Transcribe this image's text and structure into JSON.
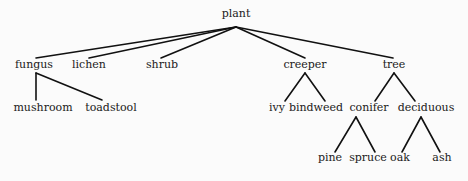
{
  "diagram": {
    "type": "tree",
    "root": "plant",
    "nodes": [
      {
        "id": "plant",
        "label": "plant",
        "x": 236,
        "y": 17,
        "anchor": [
          236,
          27
        ]
      },
      {
        "id": "fungus",
        "label": "fungus",
        "x": 34,
        "y": 68,
        "top": [
          36,
          58
        ],
        "bottom": [
          36,
          73
        ]
      },
      {
        "id": "lichen",
        "label": "lichen",
        "x": 89,
        "y": 68,
        "top": [
          89,
          58
        ]
      },
      {
        "id": "shrub",
        "label": "shrub",
        "x": 162,
        "y": 68,
        "top": [
          161,
          58
        ]
      },
      {
        "id": "creeper",
        "label": "creeper",
        "x": 305,
        "y": 68,
        "top": [
          305,
          58
        ],
        "bottom": [
          305,
          73
        ]
      },
      {
        "id": "tree",
        "label": "tree",
        "x": 394,
        "y": 68,
        "top": [
          393,
          58
        ],
        "bottom": [
          394,
          73
        ]
      },
      {
        "id": "mushroom",
        "label": "mushroom",
        "x": 43,
        "y": 111,
        "top": [
          36,
          100
        ]
      },
      {
        "id": "toadstool",
        "label": "toadstool",
        "x": 111,
        "y": 111,
        "top": [
          102,
          100
        ]
      },
      {
        "id": "ivy",
        "label": "ivy",
        "x": 277,
        "y": 111,
        "top": [
          285,
          101
        ]
      },
      {
        "id": "bindweed",
        "label": "bindweed",
        "x": 316,
        "y": 111,
        "top": [
          325,
          101
        ]
      },
      {
        "id": "conifer",
        "label": "conifer",
        "x": 369,
        "y": 111,
        "top": [
          375,
          101
        ],
        "bottom": [
          356,
          117
        ]
      },
      {
        "id": "deciduous",
        "label": "deciduous",
        "x": 426,
        "y": 111,
        "top": [
          415,
          101
        ],
        "bottom": [
          421,
          117
        ]
      },
      {
        "id": "pine",
        "label": "pine",
        "x": 330,
        "y": 161,
        "top": [
          335,
          152
        ]
      },
      {
        "id": "spruce",
        "label": "spruce",
        "x": 368,
        "y": 161,
        "top": [
          375,
          152
        ]
      },
      {
        "id": "oak",
        "label": "oak",
        "x": 400,
        "y": 161,
        "top": [
          402,
          152
        ]
      },
      {
        "id": "ash",
        "label": "ash",
        "x": 442,
        "y": 161,
        "top": [
          440,
          152
        ]
      }
    ],
    "edges": [
      {
        "from": "plant",
        "to": "fungus",
        "x1": 236,
        "y1": 27,
        "x2": 36,
        "y2": 58
      },
      {
        "from": "plant",
        "to": "lichen",
        "x1": 236,
        "y1": 27,
        "x2": 89,
        "y2": 58
      },
      {
        "from": "plant",
        "to": "shrub",
        "x1": 236,
        "y1": 27,
        "x2": 161,
        "y2": 58
      },
      {
        "from": "plant",
        "to": "creeper",
        "x1": 236,
        "y1": 27,
        "x2": 305,
        "y2": 58
      },
      {
        "from": "plant",
        "to": "tree",
        "x1": 236,
        "y1": 27,
        "x2": 393,
        "y2": 58
      },
      {
        "from": "fungus",
        "to": "mushroom",
        "x1": 36,
        "y1": 73,
        "x2": 36,
        "y2": 100
      },
      {
        "from": "fungus",
        "to": "toadstool",
        "x1": 36,
        "y1": 73,
        "x2": 102,
        "y2": 100
      },
      {
        "from": "creeper",
        "to": "ivy",
        "x1": 305,
        "y1": 73,
        "x2": 285,
        "y2": 101
      },
      {
        "from": "creeper",
        "to": "bindweed",
        "x1": 305,
        "y1": 73,
        "x2": 325,
        "y2": 101
      },
      {
        "from": "tree",
        "to": "conifer",
        "x1": 394,
        "y1": 73,
        "x2": 375,
        "y2": 101
      },
      {
        "from": "tree",
        "to": "deciduous",
        "x1": 394,
        "y1": 73,
        "x2": 415,
        "y2": 101
      },
      {
        "from": "conifer",
        "to": "pine",
        "x1": 356,
        "y1": 117,
        "x2": 335,
        "y2": 152
      },
      {
        "from": "conifer",
        "to": "spruce",
        "x1": 356,
        "y1": 117,
        "x2": 375,
        "y2": 152
      },
      {
        "from": "deciduous",
        "to": "oak",
        "x1": 421,
        "y1": 117,
        "x2": 402,
        "y2": 152
      },
      {
        "from": "deciduous",
        "to": "ash",
        "x1": 421,
        "y1": 117,
        "x2": 440,
        "y2": 152
      }
    ]
  }
}
